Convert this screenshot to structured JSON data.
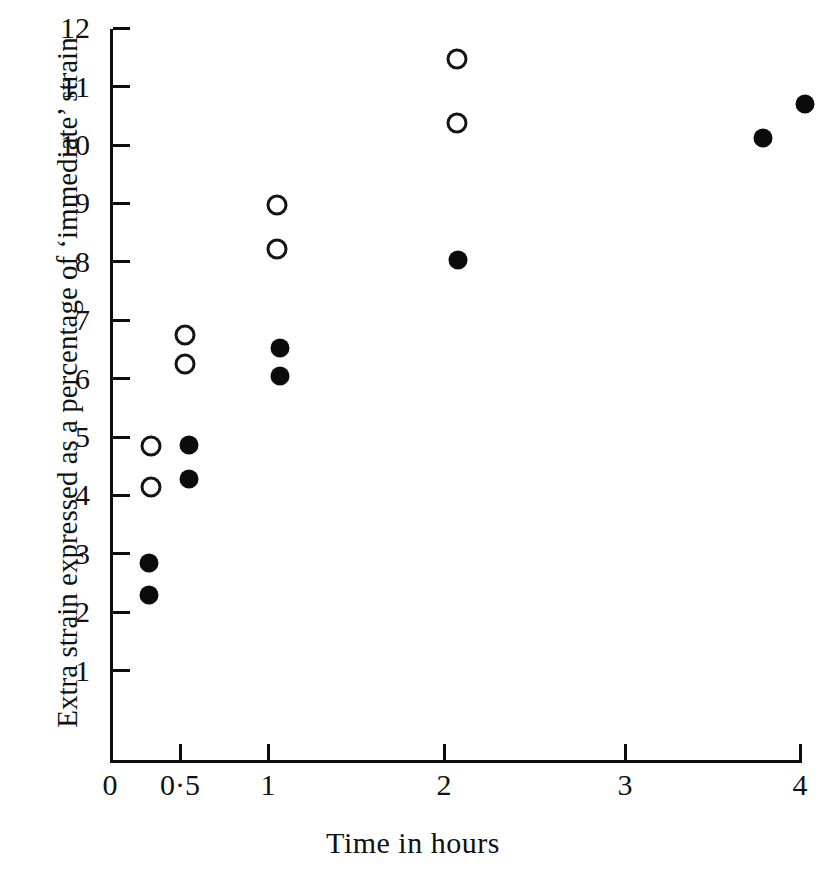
{
  "chart_data": {
    "type": "scatter",
    "title": "",
    "xlabel": "Time in hours",
    "ylabel": "Extra strain expressed as a percentage of ‘immediate’ strain",
    "xtick_labels": [
      "0",
      "0·5",
      "1",
      "2",
      "3",
      "4"
    ],
    "xtick_values": [
      0,
      0.5,
      1,
      2,
      3,
      4
    ],
    "ytick_labels": [
      "1",
      "2",
      "3",
      "4",
      "5",
      "6",
      "7",
      "8",
      "9",
      "10",
      "11",
      "12"
    ],
    "ytick_values": [
      1,
      2,
      3,
      4,
      5,
      6,
      7,
      8,
      9,
      10,
      11,
      12
    ],
    "xlim": [
      0,
      4
    ],
    "ylim": [
      0,
      12
    ],
    "grid": false,
    "legend": null,
    "x_axis_scale": "compressed-nonlinear",
    "series": [
      {
        "name": "open-circles",
        "marker": "open-circle",
        "color": "#141414",
        "points": [
          {
            "x": 0.29,
            "y": 4.85
          },
          {
            "x": 0.29,
            "y": 4.15
          },
          {
            "x": 0.53,
            "y": 6.75
          },
          {
            "x": 0.53,
            "y": 6.25
          },
          {
            "x": 1.05,
            "y": 8.97
          },
          {
            "x": 1.05,
            "y": 8.22
          },
          {
            "x": 2.07,
            "y": 11.47
          },
          {
            "x": 2.07,
            "y": 10.37
          }
        ]
      },
      {
        "name": "filled-circles",
        "marker": "filled-circle",
        "color": "#0b0b0b",
        "points": [
          {
            "x": 0.28,
            "y": 2.85
          },
          {
            "x": 0.28,
            "y": 2.3
          },
          {
            "x": 0.55,
            "y": 4.87
          },
          {
            "x": 0.55,
            "y": 4.28
          },
          {
            "x": 1.07,
            "y": 6.52
          },
          {
            "x": 1.07,
            "y": 6.05
          },
          {
            "x": 2.08,
            "y": 8.03
          },
          {
            "x": 3.79,
            "y": 10.12
          },
          {
            "x": 4.03,
            "y": 10.7
          }
        ]
      }
    ]
  },
  "geometry": {
    "plot_left_px": 110,
    "plot_bottom_px": 760,
    "y_unit_px": 58.4,
    "y_zero_px": 729,
    "x_tick_px": [
      110,
      180,
      268,
      444,
      625,
      800
    ]
  }
}
